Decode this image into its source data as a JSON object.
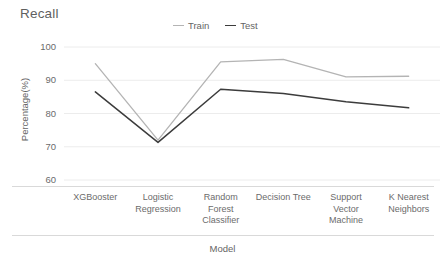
{
  "chart_data": {
    "type": "line",
    "title": "Recall",
    "xlabel": "Model",
    "ylabel": "Percentage(%)",
    "categories": [
      "XGBooster",
      "Logistic\nRegression",
      "Random\nForest\nClassifier",
      "Decision Tree",
      "Support\nVector\nMachine",
      "K Nearest\nNeighbors"
    ],
    "series": [
      {
        "name": "Train",
        "color": "#b4b4b4",
        "values": [
          95.0,
          72.0,
          95.5,
          96.3,
          91.0,
          91.2
        ]
      },
      {
        "name": "Test",
        "color": "#3c3c3c",
        "values": [
          86.5,
          71.3,
          87.3,
          86.0,
          83.5,
          81.7
        ]
      }
    ],
    "ylim": [
      60,
      100
    ],
    "yticks": [
      100,
      90,
      80,
      70,
      60
    ],
    "ytick_labels": [
      "100",
      "90",
      "80",
      "70",
      "60"
    ],
    "grid": true,
    "grid_color": "#ececec",
    "legend_position": "top-center",
    "baseline_color": "#d9d9d9"
  },
  "legend": {
    "items": [
      {
        "label": "Train",
        "color": "#b4b4b4"
      },
      {
        "label": "Test",
        "color": "#3c3c3c"
      }
    ]
  },
  "axes": {
    "y_tick_labels": [
      "100",
      "90",
      "80",
      "70",
      "60"
    ],
    "x_tick_labels": [
      "XGBooster",
      "Logistic\nRegression",
      "Random\nForest\nClassifier",
      "Decision Tree",
      "Support\nVector\nMachine",
      "K Nearest\nNeighbors"
    ]
  }
}
